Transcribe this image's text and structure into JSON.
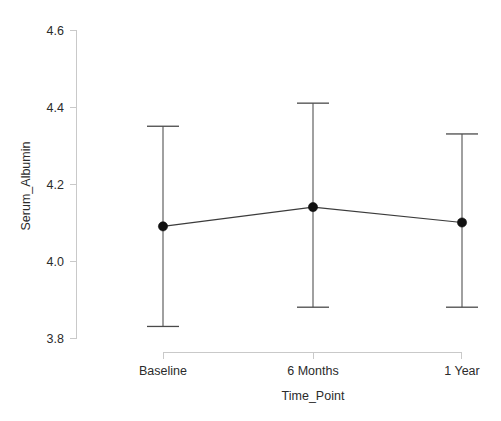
{
  "chart_data": {
    "type": "line",
    "title": "",
    "subtitle": "",
    "xlabel": "Time_Point",
    "ylabel": "Serum_Albumin",
    "categories": [
      "Baseline",
      "6 Months",
      "1 Year"
    ],
    "values": [
      4.09,
      4.14,
      4.1
    ],
    "error_upper": [
      4.35,
      4.41,
      4.33
    ],
    "error_lower": [
      3.83,
      3.88,
      3.88
    ],
    "series": [
      {
        "name": "Serum_Albumin mean",
        "values": [
          4.09,
          4.14,
          4.1
        ],
        "ci_upper": [
          4.35,
          4.41,
          4.33
        ],
        "ci_lower": [
          3.83,
          3.88,
          3.88
        ]
      }
    ],
    "ylim": [
      3.73,
      4.67
    ],
    "yticks": [
      "4.6",
      "4.4",
      "4.2",
      "4.0",
      "3.8"
    ],
    "ytick_values": [
      4.6,
      4.4,
      4.2,
      4.0,
      3.8
    ],
    "xtick_labels": [
      "Baseline",
      "6 Months",
      "1 Year"
    ],
    "grid": false,
    "legend": "none",
    "marker": "filled-circle",
    "errorbar_style": "capped-vertical",
    "colors": {
      "background": "#ffffff",
      "axis": "#c9c9c9",
      "text": "#2b2b2b",
      "line": "#3b3b3b",
      "marker": "#111111",
      "errorbar": "#4a4a4a"
    }
  },
  "axes": {
    "y_title": "Serum_Albumin",
    "x_title": "Time_Point",
    "y_tick_0": "4.6",
    "y_tick_1": "4.4",
    "y_tick_2": "4.2",
    "y_tick_3": "4.0",
    "y_tick_4": "3.8",
    "x_tick_0": "Baseline",
    "x_tick_1": "6 Months",
    "x_tick_2": "1 Year"
  }
}
